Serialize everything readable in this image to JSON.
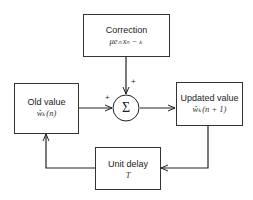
{
  "diagram": {
    "blocks": {
      "correction": {
        "label": "Correction",
        "expr": "μeₙ xₙ − ₖ"
      },
      "old_value": {
        "label": "Old value",
        "expr": "ŵₖ(n)"
      },
      "updated_value": {
        "label": "Updated value",
        "expr": "ŵₖ(n + 1)"
      },
      "unit_delay": {
        "label": "Unit delay",
        "expr": "T"
      }
    },
    "summer": {
      "symbol": "Σ",
      "sign_top": "+",
      "sign_left": "+"
    }
  }
}
